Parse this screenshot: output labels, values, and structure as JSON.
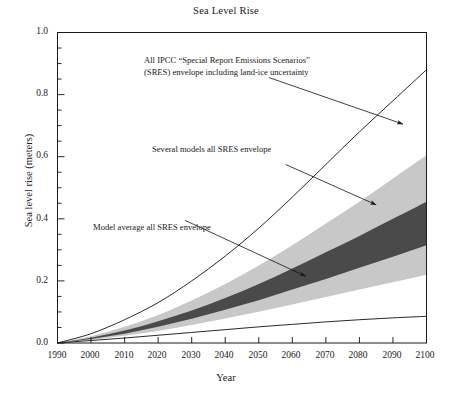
{
  "chart_data": {
    "type": "area",
    "title": "Sea Level Rise",
    "xlabel": "Year",
    "ylabel": "Sea level rise (meters)",
    "xlim": [
      1990,
      2100
    ],
    "ylim": [
      0.0,
      1.0
    ],
    "grid": false,
    "legend": "none (inline annotations with arrows)",
    "x": [
      1990,
      2000,
      2010,
      2020,
      2030,
      2040,
      2050,
      2060,
      2070,
      2080,
      2090,
      2100
    ],
    "xticklabels": [
      "1990",
      "2000",
      "2010",
      "2020",
      "2030",
      "2040",
      "2050",
      "2060",
      "2070",
      "2080",
      "2090",
      "2100"
    ],
    "yticklabels": [
      "0.0",
      "0.2",
      "0.4",
      "0.6",
      "0.8",
      "1.0"
    ],
    "ytick_minor_step": 0.05,
    "series": [
      {
        "name": "All IPCC SRES envelope including land-ice uncertainty (upper bound)",
        "role": "outer-upper-curve",
        "style": "thin black line",
        "values": [
          0.0,
          0.03,
          0.075,
          0.13,
          0.2,
          0.28,
          0.37,
          0.47,
          0.575,
          0.68,
          0.78,
          0.88
        ]
      },
      {
        "name": "Several models all SRES envelope (upper bound)",
        "role": "light-gray-band-upper",
        "style": "light gray fill",
        "values": [
          0.0,
          0.022,
          0.052,
          0.09,
          0.137,
          0.19,
          0.25,
          0.315,
          0.385,
          0.455,
          0.53,
          0.605
        ]
      },
      {
        "name": "Model average all SRES envelope (upper bound)",
        "role": "dark-gray-band-upper",
        "style": "dark gray fill",
        "values": [
          0.0,
          0.017,
          0.04,
          0.07,
          0.105,
          0.145,
          0.19,
          0.24,
          0.292,
          0.345,
          0.4,
          0.455
        ]
      },
      {
        "name": "Model average all SRES envelope (lower bound)",
        "role": "dark-gray-band-lower",
        "style": "dark gray fill",
        "values": [
          0.0,
          0.013,
          0.03,
          0.052,
          0.078,
          0.107,
          0.138,
          0.172,
          0.206,
          0.242,
          0.278,
          0.315
        ]
      },
      {
        "name": "Several models all SRES envelope (lower bound)",
        "role": "light-gray-band-lower",
        "style": "light gray fill",
        "values": [
          0.0,
          0.01,
          0.023,
          0.039,
          0.058,
          0.079,
          0.101,
          0.124,
          0.148,
          0.172,
          0.196,
          0.22
        ]
      },
      {
        "name": "All IPCC SRES envelope including land-ice uncertainty (lower bound)",
        "role": "outer-lower-curve",
        "style": "thin black line",
        "values": [
          0.0,
          0.008,
          0.016,
          0.025,
          0.034,
          0.043,
          0.052,
          0.06,
          0.068,
          0.075,
          0.081,
          0.086
        ]
      }
    ],
    "annotations": [
      {
        "id": "annotation-outer-envelope",
        "text_line1": "All IPCC “Special Report Emissions Scenarios”",
        "text_line2": "(SRES) envelope including land-ice uncertainty",
        "arrow_from": [
          2053,
          0.855
        ],
        "arrow_to": [
          2093,
          0.705
        ]
      },
      {
        "id": "annotation-several-models",
        "text_line1": "Several models all SRES envelope",
        "text_line2": "",
        "arrow_from": [
          2058,
          0.575
        ],
        "arrow_to": [
          2085,
          0.445
        ]
      },
      {
        "id": "annotation-model-average",
        "text_line1": "Model average all SRES envelope",
        "text_line2": "",
        "arrow_from": [
          2028,
          0.395
        ],
        "arrow_to": [
          2064,
          0.215
        ]
      }
    ],
    "colors": {
      "light_band": "#c8c8c8",
      "dark_band": "#4a4a4a",
      "line": "#111111",
      "background": "#ffffff",
      "text": "#1a1a1a"
    }
  }
}
